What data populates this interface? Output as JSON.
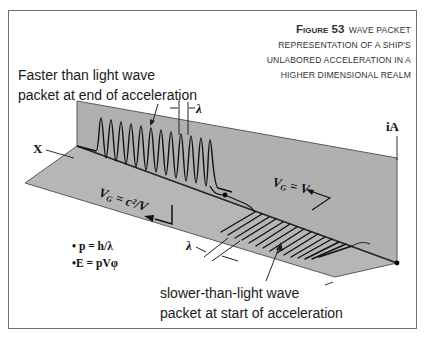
{
  "figure": {
    "number": "Figure 53",
    "title_lines": [
      "Wave Packet",
      "representation of a Ship's",
      "Unlabored Acceleration in a",
      "higher dimensional realm"
    ]
  },
  "annotations": {
    "faster_packet": [
      "Faster than light wave",
      "packet at end of acceleration"
    ],
    "slower_packet": [
      "slower-than-light wave",
      "packet at start of acceleration"
    ]
  },
  "labels": {
    "x_axis": "X",
    "ia_axis": "iA",
    "lambda_top": "λ",
    "lambda_bottom": "λ",
    "vg_upper": "VG = c²/V",
    "vg_upper_main": "V",
    "vg_upper_sub": "G",
    "vg_upper_rest": " = c²/V",
    "vg_lower_main": "V",
    "vg_lower_sub": "G",
    "vg_lower_rest": " = V"
  },
  "formulas": [
    "• p = h/λ",
    "•E = pVφ"
  ],
  "colors": {
    "plane_fill": "#b4b4b4",
    "plane_edge": "#5a5a5a",
    "ink": "#111111",
    "frame": "#6e6e6e",
    "caption_text": "#333333"
  }
}
